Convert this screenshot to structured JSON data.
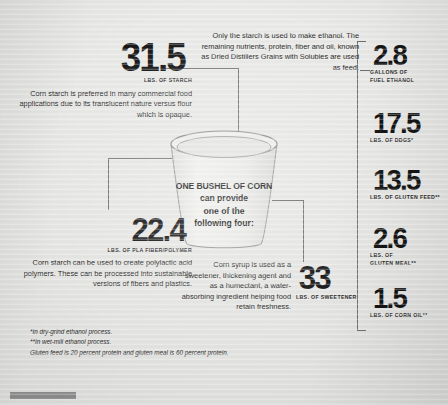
{
  "poster": {
    "center": {
      "line1": "ONE BUSHEL OF CORN",
      "line2": "can provide",
      "line3": "one of the",
      "line4": "following four:"
    },
    "left_blocks": [
      {
        "value": "31.5",
        "unit": "LBS. OF STARCH",
        "body": "Corn starch is preferred in many commercial food applications due to its translucent nature versus flour which is opaque."
      },
      {
        "value": "22.4",
        "unit": "LBS. OF PLA FIBER/POLYMER",
        "body": "Corn starch can be used to create polylactic acid polymers. These can be processed into sustainable versions of fibers and plastics."
      }
    ],
    "ethanol_note": "Only the starch is used to make ethanol. The remaining nutrients, protein, fiber and oil, known as Dried Distillers Grains with Solubles are used as feed.",
    "syrup_note": "Corn syrup is used as a sweetener, thickening agent and as a humectant, a water-absorbing ingredient helping food retain freshness.",
    "sweetener": {
      "value": "33",
      "unit": "LBS. OF SWEETENER"
    },
    "right_blocks": [
      {
        "value": "2.8",
        "unit_line1": "GALLONS OF",
        "unit_line2": "FUEL ETHANOL"
      },
      {
        "value": "17.5",
        "unit_line1": "LBS. OF DDGS*",
        "unit_line2": ""
      },
      {
        "value": "13.5",
        "unit_line1": "LBS. OF GLUTEN FEED**",
        "unit_line2": ""
      },
      {
        "value": "2.6",
        "unit_line1": "LBS. OF",
        "unit_line2": "GLUTEN MEAL**"
      },
      {
        "value": "1.5",
        "unit_line1": "LBS. OF CORN OIL**",
        "unit_line2": ""
      }
    ],
    "footnotes": [
      "*In dry-grind ethanol process.",
      "**In wet-mill ethanol process.",
      "Gluten feed is 20 percent protein and gluten meal is 60 percent protein."
    ],
    "colors": {
      "background": "#e6e6e4",
      "ink": "#141414",
      "line": "#6f6f6f",
      "bar": "#8e8e8e"
    }
  }
}
